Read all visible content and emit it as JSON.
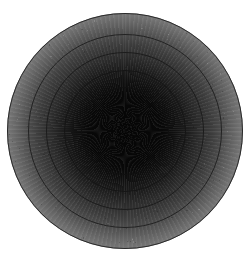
{
  "figure": {
    "width": 249,
    "height": 261,
    "background_color": "#ffffff",
    "has_axes": false,
    "has_axis_labels": false,
    "has_tick_labels": false,
    "has_legend": false,
    "has_title": false
  },
  "chart_data": {
    "type": "heatmap",
    "subtype": "filled-contour-radial-density",
    "title": "",
    "subtitle": "",
    "xlabel": "",
    "ylabel": "",
    "grid": false,
    "legend": false,
    "legend_position": "none",
    "colormap": "grayscale-inverted",
    "center": {
      "x": 125,
      "y": 131
    },
    "outer_radius": 118,
    "radial_profile": [
      {
        "r_norm": 0.0,
        "radius_px": 0,
        "value": 1.0,
        "color": "#050505"
      },
      {
        "r_norm": 0.22,
        "radius_px": 26,
        "value": 0.97,
        "color": "#080808"
      },
      {
        "r_norm": 0.3,
        "radius_px": 35,
        "value": 0.92,
        "color": "#111111"
      },
      {
        "r_norm": 0.38,
        "radius_px": 45,
        "value": 0.84,
        "color": "#1e1e1e"
      },
      {
        "r_norm": 0.44,
        "radius_px": 52,
        "value": 0.76,
        "color": "#2c2c2c"
      },
      {
        "r_norm": 0.52,
        "radius_px": 61,
        "value": 0.66,
        "color": "#3c3c3c"
      },
      {
        "r_norm": 0.59,
        "radius_px": 70,
        "value": 0.56,
        "color": "#505050"
      },
      {
        "r_norm": 0.66,
        "radius_px": 78,
        "value": 0.46,
        "color": "#686868"
      },
      {
        "r_norm": 0.74,
        "radius_px": 87,
        "value": 0.36,
        "color": "#828282"
      },
      {
        "r_norm": 0.81,
        "radius_px": 96,
        "value": 0.26,
        "color": "#a0a0a0"
      },
      {
        "r_norm": 0.88,
        "radius_px": 104,
        "value": 0.17,
        "color": "#c0c0c0"
      },
      {
        "r_norm": 0.95,
        "radius_px": 112,
        "value": 0.09,
        "color": "#dcdcdc"
      },
      {
        "r_norm": 1.0,
        "radius_px": 118,
        "value": 0.05,
        "color": "#e9e9e9"
      }
    ],
    "contours": [
      {
        "label": "level-1",
        "radius_px": 118,
        "color": "#2a2a2a",
        "line_width": 1.0
      },
      {
        "label": "level-2",
        "radius_px": 97,
        "color": "#232323",
        "line_width": 1.0
      },
      {
        "label": "level-3",
        "radius_px": 79,
        "color": "#1c1c1c",
        "line_width": 1.0
      },
      {
        "label": "level-4",
        "radius_px": 61,
        "color": "#151515",
        "line_width": 1.0
      },
      {
        "label": "level-5",
        "radius_px": 44,
        "color": "#101010",
        "line_width": 1.0
      }
    ],
    "annotations": []
  },
  "accessibility": {
    "figure_description": "Concentric greyscale contour plot: a circular disc with a near-black center fading smoothly outward to light grey, crossed by five thin dark circular contour lines."
  }
}
